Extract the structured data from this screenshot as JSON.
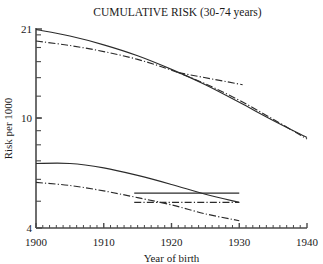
{
  "chart_data": {
    "type": "line",
    "title": "CUMULATIVE RISK (30-74 years)",
    "xlabel": "Year of birth",
    "ylabel": "Risk per 1000",
    "xlim": [
      1900,
      1940
    ],
    "ylim": [
      4,
      21
    ],
    "yscale": "log",
    "xticks": [
      1900,
      1910,
      1920,
      1930,
      1940
    ],
    "xtick_labels": [
      "1900",
      "1910",
      "1920",
      "1930",
      "1940"
    ],
    "xminor_tick_interval": 1,
    "yticks": [
      4,
      21
    ],
    "ytick_labels": [
      "4",
      "21"
    ],
    "ylabeled_ticks": [
      {
        "value": 21,
        "label": "21"
      },
      {
        "value": 10,
        "label": "10"
      },
      {
        "value": 4,
        "label": "4"
      }
    ],
    "yminor_ticks": [
      5,
      6,
      7,
      8,
      9,
      10,
      12,
      14,
      16,
      18,
      20
    ],
    "grid": false,
    "legend": "none",
    "line_color": "#2b2b2b",
    "axis_color": "#4a4a4a",
    "series": [
      {
        "name": "upper-solid",
        "style": "solid",
        "x": [
          1900,
          1905,
          1910,
          1915,
          1920,
          1925,
          1930,
          1935,
          1940
        ],
        "values": [
          20.9,
          19.8,
          18.4,
          16.8,
          15.0,
          13.2,
          11.4,
          9.8,
          8.5
        ]
      },
      {
        "name": "upper-dashdot",
        "style": "dashdot",
        "x": [
          1900,
          1905,
          1910,
          1915,
          1920,
          1925,
          1930,
          1935,
          1940
        ],
        "values": [
          19.0,
          18.3,
          17.4,
          16.3,
          14.9,
          13.3,
          11.6,
          9.9,
          8.4
        ]
      },
      {
        "name": "lower-solid",
        "style": "solid",
        "x": [
          1900,
          1905,
          1910,
          1915,
          1920,
          1925,
          1930
        ],
        "values": [
          6.85,
          6.85,
          6.6,
          6.2,
          5.75,
          5.3,
          4.95
        ]
      },
      {
        "name": "lower-dashdot",
        "style": "dashdot",
        "x": [
          1900,
          1905,
          1910,
          1915,
          1920,
          1925,
          1930
        ],
        "values": [
          5.85,
          5.7,
          5.45,
          5.15,
          4.85,
          4.5,
          4.25
        ]
      },
      {
        "name": "flat-solid",
        "style": "solid",
        "x": [
          1914.5,
          1930
        ],
        "values": [
          5.35,
          5.35
        ]
      },
      {
        "name": "flat-dashdot",
        "style": "dashdot",
        "x": [
          1914.5,
          1930
        ],
        "values": [
          4.95,
          4.95
        ]
      },
      {
        "name": "upper-flat-dashdot",
        "style": "dashdot",
        "x": [
          1921,
          1930.5
        ],
        "values": [
          14.6,
          13.2
        ]
      }
    ]
  }
}
